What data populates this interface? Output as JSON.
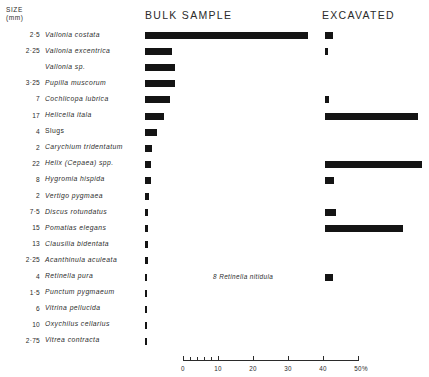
{
  "header": {
    "size_label_line1": "SIZE",
    "size_label_line2": "(mm)",
    "bulk_sample": "BULK  SAMPLE",
    "excavated": "EXCAVATED"
  },
  "annotation": {
    "retinella_nitidula": "8  Retinella  nitidula"
  },
  "axis": {
    "unit": "%",
    "ticks": [
      "0",
      "10",
      "20",
      "30",
      "40",
      "50"
    ],
    "min": 0,
    "max": 50
  },
  "chart_data": {
    "type": "bar",
    "title": "",
    "xlabel": "%",
    "ylabel": "",
    "xlim": [
      0,
      50
    ],
    "grid": false,
    "legend": [
      "BULK  SAMPLE",
      "EXCAVATED"
    ],
    "categories": [
      "Vallonia costata",
      "Vallonia excentrica",
      "Vallonia sp.",
      "Pupilla muscorum",
      "Cochlicopa lubrica",
      "Helicella itala",
      "Slugs",
      "Carychium tridentatum",
      "Helix (Cepaea) spp.",
      "Hygromia hispida",
      "Vertigo pygmaea",
      "Discus rotundatus",
      "Pomatias elegans",
      "Clausilia bidentata",
      "Acanthinula aculeata",
      "Retinella pura",
      "Punctum pygmaeum",
      "Vitrina pellucida",
      "Oxychilus cellarius",
      "Vitrea contracta"
    ],
    "sizes_mm": [
      "2·5",
      "2·25",
      "",
      "3·25",
      "7",
      "17",
      "4",
      "2",
      "22",
      "8",
      "2",
      "7·5",
      "15",
      "13",
      "2·25",
      "4",
      "1·5",
      "6",
      "10",
      "2·75"
    ],
    "series": [
      {
        "name": "BULK  SAMPLE",
        "values": [
          46.5,
          7.8,
          8.7,
          8.7,
          7.0,
          5.3,
          3.5,
          2.0,
          1.6,
          1.6,
          1.2,
          0.9,
          0.9,
          0.9,
          0.9,
          0.6,
          0.6,
          0.6,
          0.4,
          0.4
        ]
      },
      {
        "name": "EXCAVATED",
        "values": [
          2.2,
          0.9,
          0.0,
          0.0,
          1.2,
          26.5,
          0.0,
          0.0,
          27.8,
          2.6,
          0.0,
          3.1,
          22.3,
          0.0,
          0.0,
          2.2,
          0.0,
          0.0,
          0.0,
          0.0
        ]
      }
    ]
  }
}
